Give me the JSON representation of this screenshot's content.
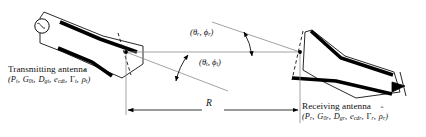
{
  "figure": {
    "stroke_color": "#000000",
    "thin_line_color": "#7a7a7a",
    "background": "#ffffff"
  },
  "transmitting_antenna": {
    "name": "Transmitting antenna",
    "params_open": "(",
    "params_close": ")",
    "params": [
      {
        "symbol": "P",
        "sub": "t"
      },
      {
        "symbol": "G",
        "sub": "0t"
      },
      {
        "symbol": "D",
        "sub": "gt"
      },
      {
        "symbol": "e",
        "sub": "cdt"
      },
      {
        "symbol": "Γ",
        "sub": "t",
        "upright": true
      },
      {
        "symbol": "ρ",
        "sub": "t",
        "hat": true
      }
    ],
    "params_text": "(Pt, G0t, Dgt, ecdt, Γt, ρ̂t)"
  },
  "receiving_antenna": {
    "name": "Receiving antenna",
    "params_open": "(",
    "params_close": ")",
    "params": [
      {
        "symbol": "P",
        "sub": "r"
      },
      {
        "symbol": "G",
        "sub": "0r"
      },
      {
        "symbol": "D",
        "sub": "gr"
      },
      {
        "symbol": "e",
        "sub": "cdr"
      },
      {
        "symbol": "Γ",
        "sub": "r",
        "upright": true
      },
      {
        "symbol": "ρ",
        "sub": "r",
        "hat": true
      }
    ],
    "params_text": "(Pr, G0r, Dgr, ecdr, Γr, ρ̂r)"
  },
  "angles": {
    "transmit": {
      "open": "(",
      "theta": "θ",
      "theta_sub": "t",
      "comma": ", ",
      "phi": "ϕ",
      "phi_sub": "t",
      "close": ")"
    },
    "receive": {
      "open": "(",
      "theta": "θ",
      "theta_sub": "r",
      "comma": ", ",
      "phi": "ϕ",
      "phi_sub": "r",
      "close": ")"
    }
  },
  "distance": {
    "symbol": "R",
    "description": "separation distance between antennas"
  }
}
